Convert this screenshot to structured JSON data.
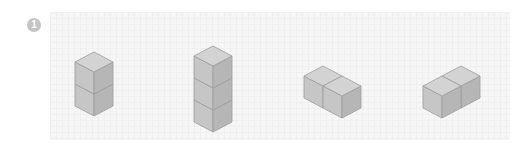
{
  "problem": {
    "number": "1"
  },
  "colors": {
    "top_face": "#d2d2d2",
    "left_face": "#c4c4c4",
    "right_face": "#b4b4b4",
    "edge": "#9a9a9a",
    "panel_bg": "#f6f6f6",
    "badge_bg": "#c4c4c4"
  },
  "figures": [
    {
      "id": "figure-1",
      "description": "2 cubes stacked vertically",
      "cube_count": 2
    },
    {
      "id": "figure-2",
      "description": "3 cubes stacked vertically",
      "cube_count": 3
    },
    {
      "id": "figure-3",
      "description": "2 cubes side by side, extending right-down",
      "cube_count": 2
    },
    {
      "id": "figure-4",
      "description": "2 cubes side by side, extending right-up",
      "cube_count": 2
    }
  ]
}
